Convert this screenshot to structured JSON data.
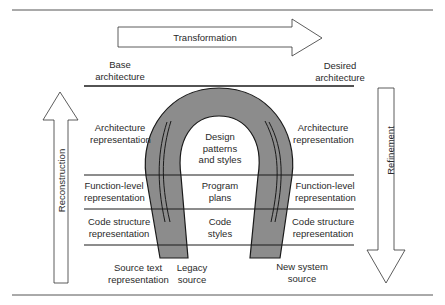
{
  "diagram": {
    "arrows": {
      "transformation": "Transformation",
      "reconstruction": "Reconstruction",
      "refinement": "Refinement"
    },
    "left_labels": {
      "base": [
        "Base",
        "architecture"
      ],
      "architecture": [
        "Architecture",
        "representation"
      ],
      "function": [
        "Function-level",
        "representation"
      ],
      "code": [
        "Code structure",
        "representation"
      ],
      "source": [
        "Source text",
        "representation"
      ]
    },
    "right_labels": {
      "desired": [
        "Desired",
        "architecture"
      ],
      "architecture": [
        "Architecture",
        "representation"
      ],
      "function": [
        "Function-level",
        "representation"
      ],
      "code": [
        "Code structure",
        "representation"
      ]
    },
    "center_labels": {
      "design": [
        "Design",
        "patterns",
        "and styles"
      ],
      "program": [
        "Program",
        "plans"
      ],
      "code": [
        "Code",
        "styles"
      ]
    },
    "bottom_labels": {
      "legacy": [
        "Legacy",
        "source"
      ],
      "new_system": [
        "New system",
        "source"
      ]
    },
    "colors": {
      "horseshoe_fill": "#8c8c8c",
      "line": "#1a1a1a",
      "arrow_fill": "#ffffff"
    }
  }
}
